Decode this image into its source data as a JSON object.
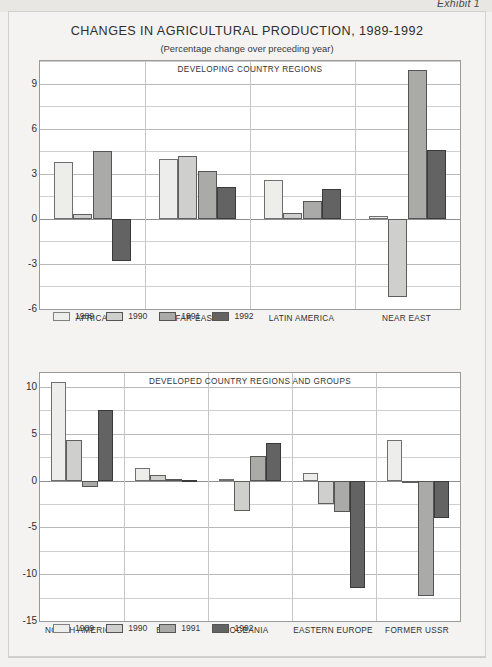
{
  "exhibit": {
    "label": "Exhibit 1"
  },
  "header": {
    "title": "CHANGES IN AGRICULTURAL PRODUCTION, 1989-1992",
    "subtitle": "(Percentage change over preceding year)"
  },
  "legend_labels": [
    "1989",
    "1990",
    "1991",
    "1992"
  ],
  "series_colors": [
    "#ededeb",
    "#cfcfcd",
    "#aaaaa8",
    "#636363"
  ],
  "chart_data": [
    {
      "type": "bar",
      "title": "DEVELOPING COUNTRY REGIONS",
      "xlabel": "",
      "ylabel": "",
      "ylim": [
        -6,
        10.5
      ],
      "yticks": [
        9,
        6,
        3,
        0,
        -3,
        -6
      ],
      "ytick_labels": [
        "9",
        "6",
        "3",
        "0",
        "-3",
        "-6"
      ],
      "minor_step": 1.5,
      "grid": true,
      "legend_position": "bottom-left",
      "categories": [
        "AFRICA",
        "FAR EAST",
        "LATIN AMERICA",
        "NEAR EAST"
      ],
      "series": [
        {
          "name": "1989",
          "values": [
            3.8,
            4.0,
            2.6,
            0.2
          ]
        },
        {
          "name": "1990",
          "values": [
            0.3,
            4.2,
            0.4,
            -5.2
          ]
        },
        {
          "name": "1991",
          "values": [
            4.5,
            3.2,
            1.2,
            9.9
          ]
        },
        {
          "name": "1992",
          "values": [
            -2.8,
            2.1,
            2.0,
            4.6
          ]
        }
      ]
    },
    {
      "type": "bar",
      "title": "DEVELOPED COUNTRY REGIONS AND GROUPS",
      "xlabel": "",
      "ylabel": "",
      "ylim": [
        -15,
        11.5
      ],
      "yticks": [
        10,
        5,
        0,
        -5,
        -10,
        -15
      ],
      "ytick_labels": [
        "10",
        "5",
        "0",
        "-5",
        "-10",
        "-15"
      ],
      "minor_step": 2.5,
      "grid": true,
      "legend_position": "bottom-left",
      "categories": [
        "NORTH AMERICA",
        "EEC",
        "OCEANIA",
        "EASTERN EUROPE",
        "FORMER USSR"
      ],
      "series": [
        {
          "name": "1989",
          "values": [
            10.5,
            1.3,
            0.2,
            0.8,
            4.3
          ]
        },
        {
          "name": "1990",
          "values": [
            4.3,
            0.6,
            -3.2,
            -2.5,
            0.0
          ]
        },
        {
          "name": "1991",
          "values": [
            -0.7,
            0.2,
            2.6,
            -3.4,
            -12.3
          ]
        },
        {
          "name": "1992",
          "values": [
            7.5,
            0.1,
            4.0,
            -11.5,
            -4.0
          ]
        }
      ]
    }
  ]
}
